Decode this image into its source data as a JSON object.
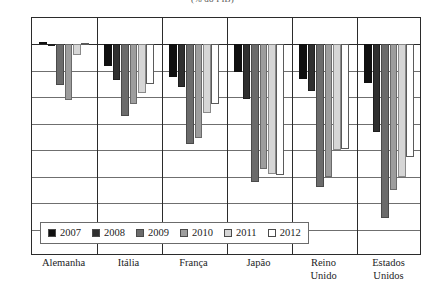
{
  "chart_data": {
    "type": "bar",
    "title": "(% do PIB)",
    "xlabel": "",
    "ylabel": "",
    "ylim": [
      -16,
      2
    ],
    "yticks": [
      2,
      0,
      -2,
      -4,
      -6,
      -8,
      -10,
      -12,
      -14,
      -16
    ],
    "grid": true,
    "legend_position": "bottom-inside",
    "categories": [
      "Alemanha",
      "Itália",
      "França",
      "Japão",
      "Reino Unido",
      "Estados Unidos"
    ],
    "series": [
      {
        "name": "2007",
        "color": "#101010",
        "values": [
          0.2,
          -1.6,
          -2.5,
          -2.1,
          -2.6,
          -2.9
        ]
      },
      {
        "name": "2008",
        "color": "#2f2f2f",
        "values": [
          -0.1,
          -2.7,
          -3.2,
          -4.1,
          -3.5,
          -6.6
        ]
      },
      {
        "name": "2009",
        "color": "#6b6b6b",
        "values": [
          -3.1,
          -5.4,
          -7.5,
          -10.4,
          -10.8,
          -13.1
        ]
      },
      {
        "name": "2010",
        "color": "#9d9d9d",
        "values": [
          -4.2,
          -4.5,
          -7.1,
          -9.4,
          -10.0,
          -11.0
        ]
      },
      {
        "name": "2011",
        "color": "#d6d6d6",
        "values": [
          -0.8,
          -3.7,
          -5.2,
          -9.8,
          -8.0,
          -10.0
        ]
      },
      {
        "name": "2012",
        "color": "#ffffff",
        "values": [
          0.1,
          -3.0,
          -4.5,
          -9.9,
          -7.9,
          -8.5
        ]
      }
    ]
  },
  "legend": {
    "items": [
      {
        "label": "2007"
      },
      {
        "label": "2008"
      },
      {
        "label": "2009"
      },
      {
        "label": "2010"
      },
      {
        "label": "2011"
      },
      {
        "label": "2012"
      }
    ]
  }
}
